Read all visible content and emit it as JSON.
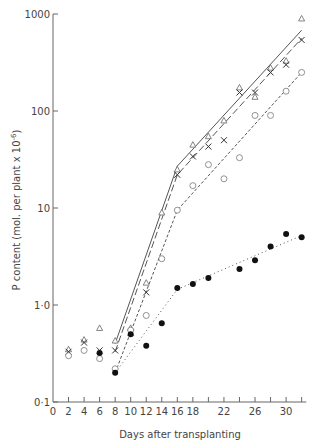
{
  "chart_data": {
    "type": "scatter",
    "title": "",
    "xlabel": "Days after transplanting",
    "ylabel": "P content (mol. per plant x 10^-6)",
    "ylabel_main": "P content (mol. per plant x 10",
    "ylabel_sup": "-6",
    "ylabel_close": ")",
    "yscale": "log",
    "xlim": [
      0,
      33
    ],
    "ylim": [
      0.1,
      1000
    ],
    "grid": false,
    "legend": "none",
    "x_ticks": [
      0,
      2,
      4,
      6,
      8,
      10,
      12,
      14,
      16,
      18,
      20,
      22,
      24,
      26,
      28,
      30,
      32
    ],
    "x_tick_labels": [
      "0",
      "2",
      "4",
      "6",
      "8",
      "10",
      "12",
      "14",
      "16",
      "18",
      "",
      "22",
      "",
      "26",
      "",
      "30",
      ""
    ],
    "y_ticks": [
      0.1,
      1,
      10,
      100,
      1000
    ],
    "y_tick_labels": [
      "0·1",
      "1·0",
      "10",
      "100",
      "1000"
    ],
    "series": [
      {
        "name": "triangle",
        "marker": "open-triangle",
        "points": [
          [
            2,
            0.35
          ],
          [
            4,
            0.44
          ],
          [
            6,
            0.58
          ],
          [
            8,
            0.43
          ],
          [
            10,
            0.58
          ],
          [
            12,
            1.7
          ],
          [
            14,
            9
          ],
          [
            16,
            25
          ],
          [
            18,
            45
          ],
          [
            20,
            55
          ],
          [
            22,
            80
          ],
          [
            24,
            175
          ],
          [
            26,
            140
          ],
          [
            28,
            280
          ],
          [
            30,
            330
          ],
          [
            32,
            900
          ]
        ],
        "fit_line": {
          "style": "solid",
          "points": [
            [
              8,
              0.4
            ],
            [
              16,
              27
            ],
            [
              32,
              680
            ]
          ]
        }
      },
      {
        "name": "cross",
        "marker": "x",
        "points": [
          [
            2,
            0.33
          ],
          [
            4,
            0.41
          ],
          [
            6,
            0.34
          ],
          [
            8,
            0.34
          ],
          [
            10,
            0.52
          ],
          [
            12,
            1.35
          ],
          [
            16,
            22
          ],
          [
            18,
            34
          ],
          [
            20,
            43
          ],
          [
            22,
            50
          ],
          [
            24,
            155
          ],
          [
            26,
            155
          ],
          [
            28,
            250
          ],
          [
            30,
            300
          ],
          [
            32,
            540
          ]
        ],
        "fit_line": {
          "style": "long-dash",
          "points": [
            [
              8,
              0.33
            ],
            [
              16,
              22
            ],
            [
              32,
              560
            ]
          ]
        }
      },
      {
        "name": "open-circle",
        "marker": "open-circle",
        "points": [
          [
            2,
            0.3
          ],
          [
            4,
            0.34
          ],
          [
            6,
            0.28
          ],
          [
            8,
            0.22
          ],
          [
            10,
            0.55
          ],
          [
            12,
            0.78
          ],
          [
            14,
            3
          ],
          [
            16,
            9.5
          ],
          [
            18,
            17
          ],
          [
            20,
            28
          ],
          [
            22,
            20
          ],
          [
            24,
            33
          ],
          [
            26,
            90
          ],
          [
            28,
            90
          ],
          [
            30,
            160
          ],
          [
            32,
            250
          ]
        ],
        "fit_line": {
          "style": "short-dash",
          "points": [
            [
              8,
              0.2
            ],
            [
              16,
              9.5
            ],
            [
              32,
              250
            ]
          ]
        }
      },
      {
        "name": "filled-circle",
        "marker": "filled-circle",
        "points": [
          [
            6,
            0.32
          ],
          [
            8,
            0.2
          ],
          [
            10,
            0.5
          ],
          [
            12,
            0.38
          ],
          [
            14,
            0.65
          ],
          [
            16,
            1.5
          ],
          [
            18,
            1.65
          ],
          [
            20,
            1.9
          ],
          [
            24,
            2.35
          ],
          [
            26,
            2.9
          ],
          [
            28,
            4.0
          ],
          [
            30,
            5.4
          ],
          [
            32,
            5.0
          ]
        ],
        "fit_line": {
          "style": "dotted",
          "points": [
            [
              8,
              0.2
            ],
            [
              16,
              1.45
            ],
            [
              32,
              5.2
            ]
          ]
        }
      }
    ]
  }
}
